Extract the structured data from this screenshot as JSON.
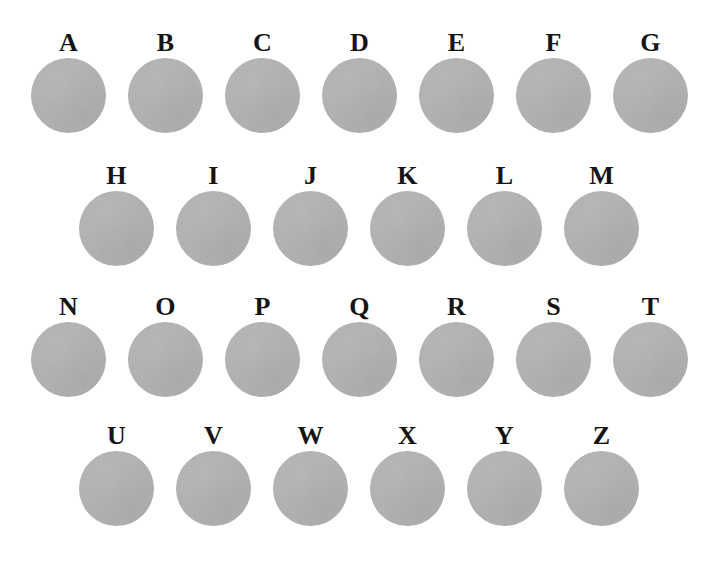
{
  "figure": {
    "width": 713,
    "height": 569,
    "background_color": "#ffffff",
    "disc_color": "#b3b3b3",
    "label_color": "#141414",
    "disc_diameter": 75,
    "column_pitch": 97
  },
  "rows": [
    {
      "row_index": 1,
      "left": 20,
      "top": 30,
      "count": 7,
      "samples": [
        {
          "label": "A"
        },
        {
          "label": "B"
        },
        {
          "label": "C"
        },
        {
          "label": "D"
        },
        {
          "label": "E"
        },
        {
          "label": "F"
        },
        {
          "label": "G"
        }
      ]
    },
    {
      "row_index": 2,
      "left": 68,
      "top": 163,
      "count": 6,
      "samples": [
        {
          "label": "H"
        },
        {
          "label": "I"
        },
        {
          "label": "J"
        },
        {
          "label": "K"
        },
        {
          "label": "L"
        },
        {
          "label": "M"
        }
      ]
    },
    {
      "row_index": 3,
      "left": 20,
      "top": 294,
      "count": 7,
      "samples": [
        {
          "label": "N"
        },
        {
          "label": "O"
        },
        {
          "label": "P"
        },
        {
          "label": "Q"
        },
        {
          "label": "R"
        },
        {
          "label": "S"
        },
        {
          "label": "T"
        }
      ]
    },
    {
      "row_index": 4,
      "left": 68,
      "top": 423,
      "count": 6,
      "samples": [
        {
          "label": "U"
        },
        {
          "label": "V"
        },
        {
          "label": "W"
        },
        {
          "label": "X"
        },
        {
          "label": "Y"
        },
        {
          "label": "Z"
        }
      ]
    }
  ]
}
